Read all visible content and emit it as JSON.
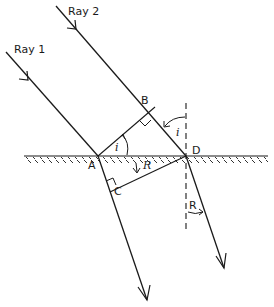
{
  "diagram": {
    "colors": {
      "ink": "#1a1a1a",
      "background": "#ffffff"
    },
    "labels": {
      "ray1": "Ray 1",
      "ray2": "Ray 2",
      "point_a": "A",
      "point_b": "B",
      "point_c": "C",
      "point_d": "D",
      "angle_i_at_a": "i",
      "angle_i_at_d": "i",
      "angle_r_at_a": "R",
      "angle_r_at_d": "R"
    },
    "elements": [
      "surface-line-with-hatching",
      "incident-ray-1",
      "incident-ray-2",
      "refracted-ray-1",
      "refracted-ray-2",
      "incident-wavefront-AB",
      "refracted-wavefront-CD",
      "normal-at-D-dashed",
      "right-angle-mark-B",
      "right-angle-mark-C"
    ]
  }
}
